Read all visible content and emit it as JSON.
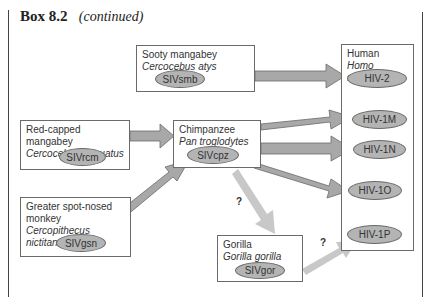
{
  "header": {
    "box_label": "Box 8.2",
    "continued_label": "(continued)"
  },
  "nodes": {
    "sooty": {
      "common": "Sooty mangabey",
      "scientific": "Cercocebus atys",
      "virus": "SIVsmb"
    },
    "red_capped": {
      "common": "Red-capped mangabey",
      "scientific": "Cercocebus torquatus",
      "virus": "SIVrcm"
    },
    "chimpanzee": {
      "common": "Chimpanzee",
      "scientific": "Pan troglodytes",
      "virus": "SIVcpz"
    },
    "greater": {
      "common_line1": "Greater spot-nosed",
      "common_line2": "monkey",
      "scientific": "Cercopithecus nictitans",
      "virus": "SIVgsn"
    },
    "gorilla": {
      "common": "Gorilla",
      "scientific": "Gorilla gorilla",
      "virus": "SIVgor"
    },
    "human": {
      "common": "Human",
      "scientific": "Homo sapiens",
      "viruses": [
        "HIV-2",
        "HIV-1M",
        "HIV-1N",
        "HIV-1O",
        "HIV-1P"
      ]
    }
  },
  "edges": [
    {
      "from": "SIVsmb",
      "to": "HIV-2",
      "uncertain": false
    },
    {
      "from": "SIVrcm",
      "to": "SIVcpz",
      "uncertain": false
    },
    {
      "from": "SIVgsn",
      "to": "SIVcpz",
      "uncertain": false
    },
    {
      "from": "SIVcpz",
      "to": "HIV-1M",
      "uncertain": false
    },
    {
      "from": "SIVcpz",
      "to": "HIV-1N",
      "uncertain": false
    },
    {
      "from": "SIVcpz",
      "to": "HIV-1O",
      "uncertain": false
    },
    {
      "from": "SIVcpz",
      "to": "SIVgor",
      "uncertain": true
    },
    {
      "from": "SIVgor",
      "to": "HIV-1P",
      "uncertain": true
    }
  ],
  "annotations": {
    "uncertain_mark_1": "?",
    "uncertain_mark_2": "?"
  },
  "colors": {
    "arrow_dark": "#a8a8a8",
    "arrow_light": "#c8c8c8",
    "oval_fill": "#b4b4b4",
    "border": "#6a6a6a"
  }
}
